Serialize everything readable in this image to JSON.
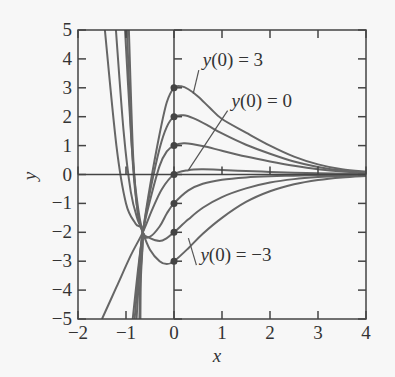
{
  "chart_data": {
    "type": "line",
    "title": "",
    "xlabel": "x",
    "ylabel": "y",
    "xlim": [
      -2,
      4
    ],
    "ylim": [
      -5,
      5
    ],
    "xticks": [
      -2,
      -1,
      0,
      1,
      2,
      3,
      4
    ],
    "yticks": [
      5,
      4,
      3,
      2,
      1,
      0,
      -1,
      -2,
      -3,
      -4,
      -5
    ],
    "grid": false,
    "line_color": "#666666",
    "common_point": [
      -0.65,
      -2
    ],
    "initial_points": [
      [
        0,
        3
      ],
      [
        0,
        2
      ],
      [
        0,
        1
      ],
      [
        0,
        0
      ],
      [
        0,
        -1
      ],
      [
        0,
        -2
      ],
      [
        0,
        -3
      ]
    ],
    "annotations": [
      {
        "text": "y(0) = 3",
        "at": [
          0.6,
          3.75
        ],
        "points_to": [
          0.4,
          2.8
        ]
      },
      {
        "text": "y(0) = 0",
        "at": [
          1.2,
          2.35
        ],
        "points_to": [
          0.3,
          0.15
        ]
      },
      {
        "text": "y(0) = −3",
        "at": [
          0.55,
          -3.0
        ],
        "points_to": [
          0.3,
          -2.2
        ]
      }
    ],
    "series": [
      {
        "name": "y(0) = 3",
        "points": [
          [
            -0.86,
            -5
          ],
          [
            -0.75,
            -3.3
          ],
          [
            -0.65,
            -2
          ],
          [
            -0.5,
            -0.4
          ],
          [
            -0.3,
            1.4
          ],
          [
            -0.15,
            2.5
          ],
          [
            0,
            3
          ],
          [
            0.15,
            3.05
          ],
          [
            0.3,
            2.95
          ],
          [
            0.5,
            2.7
          ],
          [
            0.75,
            2.3
          ],
          [
            1,
            1.92
          ],
          [
            1.5,
            1.45
          ],
          [
            2,
            1.0
          ],
          [
            2.5,
            0.62
          ],
          [
            3,
            0.35
          ],
          [
            3.5,
            0.18
          ],
          [
            4,
            0.1
          ]
        ]
      },
      {
        "name": "y(0) = 2",
        "points": [
          [
            -0.82,
            -5
          ],
          [
            -0.72,
            -3.0
          ],
          [
            -0.65,
            -2
          ],
          [
            -0.5,
            -0.6
          ],
          [
            -0.3,
            0.9
          ],
          [
            -0.15,
            1.65
          ],
          [
            0,
            2
          ],
          [
            0.2,
            2.05
          ],
          [
            0.4,
            1.95
          ],
          [
            0.7,
            1.7
          ],
          [
            1,
            1.42
          ],
          [
            1.5,
            1.03
          ],
          [
            2,
            0.72
          ],
          [
            2.5,
            0.45
          ],
          [
            3,
            0.26
          ],
          [
            3.5,
            0.14
          ],
          [
            4,
            0.08
          ]
        ]
      },
      {
        "name": "y(0) = 1",
        "points": [
          [
            -0.78,
            -5
          ],
          [
            -0.7,
            -2.8
          ],
          [
            -0.65,
            -2
          ],
          [
            -0.5,
            -0.9
          ],
          [
            -0.3,
            0.3
          ],
          [
            -0.15,
            0.8
          ],
          [
            0,
            1
          ],
          [
            0.2,
            1.08
          ],
          [
            0.4,
            1.05
          ],
          [
            0.7,
            0.95
          ],
          [
            1,
            0.82
          ],
          [
            1.5,
            0.62
          ],
          [
            2,
            0.45
          ],
          [
            2.5,
            0.3
          ],
          [
            3,
            0.18
          ],
          [
            3.5,
            0.1
          ],
          [
            4,
            0.06
          ]
        ]
      },
      {
        "name": "y(0) = 0",
        "points": [
          [
            -1.5,
            -5
          ],
          [
            -1.2,
            -3.9
          ],
          [
            -0.9,
            -2.8
          ],
          [
            -0.65,
            -2
          ],
          [
            -0.45,
            -1.2
          ],
          [
            -0.25,
            -0.5
          ],
          [
            0,
            0
          ],
          [
            0.3,
            0.15
          ],
          [
            0.6,
            0.18
          ],
          [
            1,
            0.16
          ],
          [
            1.5,
            0.12
          ],
          [
            2,
            0.09
          ],
          [
            2.5,
            0.06
          ],
          [
            3,
            0.04
          ],
          [
            3.5,
            0.03
          ],
          [
            4,
            0.02
          ]
        ]
      },
      {
        "name": "y(0) = -1",
        "points": [
          [
            -1.02,
            5
          ],
          [
            -0.9,
            1.5
          ],
          [
            -0.8,
            -0.5
          ],
          [
            -0.65,
            -2
          ],
          [
            -0.5,
            -2.15
          ],
          [
            -0.3,
            -1.8
          ],
          [
            -0.15,
            -1.35
          ],
          [
            0,
            -1
          ],
          [
            0.3,
            -0.55
          ],
          [
            0.6,
            -0.32
          ],
          [
            1,
            -0.18
          ],
          [
            1.5,
            -0.1
          ],
          [
            2,
            -0.06
          ],
          [
            2.5,
            -0.04
          ],
          [
            3,
            -0.02
          ],
          [
            4,
            -0.01
          ]
        ]
      },
      {
        "name": "y(0) = -2",
        "points": [
          [
            -0.98,
            5
          ],
          [
            -0.88,
            1.0
          ],
          [
            -0.78,
            -1.0
          ],
          [
            -0.65,
            -2
          ],
          [
            -0.5,
            -2.2
          ],
          [
            -0.3,
            -2.3
          ],
          [
            -0.15,
            -2.2
          ],
          [
            0,
            -2
          ],
          [
            0.3,
            -1.55
          ],
          [
            0.6,
            -1.15
          ],
          [
            1,
            -0.78
          ],
          [
            1.5,
            -0.48
          ],
          [
            2,
            -0.28
          ],
          [
            2.5,
            -0.16
          ],
          [
            3,
            -0.09
          ],
          [
            3.5,
            -0.05
          ],
          [
            4,
            -0.03
          ]
        ]
      },
      {
        "name": "y(0) = -3",
        "points": [
          [
            -0.94,
            5
          ],
          [
            -0.85,
            0.6
          ],
          [
            -0.75,
            -1.4
          ],
          [
            -0.65,
            -2
          ],
          [
            -0.5,
            -2.6
          ],
          [
            -0.3,
            -3.0
          ],
          [
            -0.15,
            -3.1
          ],
          [
            0,
            -3
          ],
          [
            0.3,
            -2.55
          ],
          [
            0.6,
            -2.05
          ],
          [
            1,
            -1.5
          ],
          [
            1.5,
            -0.95
          ],
          [
            2,
            -0.58
          ],
          [
            2.5,
            -0.34
          ],
          [
            3,
            -0.19
          ],
          [
            3.5,
            -0.1
          ],
          [
            4,
            -0.05
          ]
        ]
      },
      {
        "name": "steep-1",
        "points": [
          [
            -1.44,
            5
          ],
          [
            -1.2,
            1.0
          ],
          [
            -1.0,
            -1.0
          ],
          [
            -0.8,
            -1.7
          ],
          [
            -0.65,
            -2
          ],
          [
            -0.7,
            -3.5
          ],
          [
            -0.72,
            -5
          ]
        ]
      },
      {
        "name": "steep-2",
        "points": [
          [
            -1.21,
            5
          ],
          [
            -1.05,
            1.5
          ],
          [
            -0.9,
            -0.6
          ],
          [
            -0.75,
            -1.6
          ],
          [
            -0.65,
            -2
          ],
          [
            -0.69,
            -3.6
          ],
          [
            -0.7,
            -5
          ]
        ]
      }
    ]
  }
}
